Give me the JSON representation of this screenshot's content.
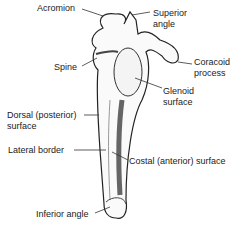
{
  "diagram": {
    "labels": {
      "acromion": "Acromion",
      "superior_angle_1": "Superior",
      "superior_angle_2": "angle",
      "coracoid_1": "Coracoid",
      "coracoid_2": "process",
      "spine": "Spine",
      "glenoid_1": "Glenoid",
      "glenoid_2": "surface",
      "dorsal_1": "Dorsal (posterior)",
      "dorsal_2": "surface",
      "lateral_border": "Lateral border",
      "costal": "Costal (anterior) surface",
      "inferior_angle": "Inferior angle"
    }
  }
}
